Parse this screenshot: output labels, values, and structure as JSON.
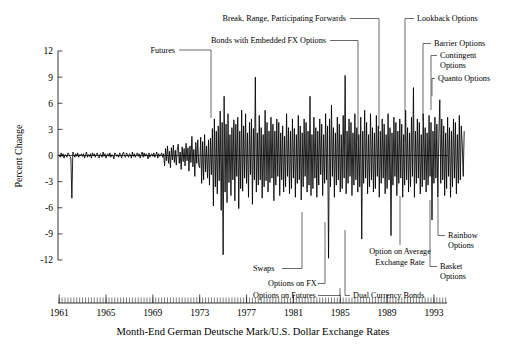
{
  "chart_data": {
    "type": "line",
    "title": "",
    "subtitle": "",
    "xlabel": "Month-End German Deutsche Mark/U.S. Dollar Exchange Rates",
    "ylabel": "Percent Change",
    "xlim": [
      1960.9,
      1994.2
    ],
    "ylim": [
      -12,
      12
    ],
    "grid": false,
    "legend": null,
    "x_ticks": [
      "1961",
      "1965",
      "1969",
      "1973",
      "1977",
      "1981",
      "1985",
      "1989",
      "1993"
    ],
    "x_tick_values": [
      1961,
      1965,
      1969,
      1973,
      1977,
      1981,
      1985,
      1989,
      1993
    ],
    "x_minor_tick_step": 0.25,
    "y_ticks": [
      "12",
      "9",
      "6",
      "3",
      "0",
      "-3",
      "-6",
      "-9",
      "-12"
    ],
    "y_tick_values": [
      12,
      9,
      6,
      3,
      0,
      -3,
      -6,
      -9,
      -12
    ],
    "series": [
      {
        "name": "Monthly percent change, DM/USD",
        "x_start": 1961.0,
        "x_step": 0.0833333,
        "values": [
          0.1,
          -0.2,
          0.3,
          -0.1,
          0.2,
          -0.3,
          0.1,
          0.0,
          -0.2,
          0.3,
          0.1,
          -0.1,
          -0.3,
          -4.9,
          0.4,
          0.1,
          -0.2,
          0.2,
          -0.1,
          0.3,
          -0.2,
          0.1,
          0.0,
          0.2,
          -0.1,
          0.2,
          -0.3,
          0.1,
          0.4,
          -0.2,
          0.1,
          -0.1,
          0.2,
          -0.3,
          0.3,
          0.0,
          0.2,
          -0.2,
          0.1,
          0.3,
          -0.1,
          -0.3,
          0.2,
          0.1,
          -0.2,
          0.4,
          -0.1,
          0.2,
          -0.3,
          0.1,
          0.2,
          -0.1,
          0.3,
          -0.2,
          0.1,
          0.0,
          -0.4,
          0.3,
          0.2,
          -0.1,
          0.1,
          -0.2,
          0.3,
          0.1,
          -0.3,
          0.2,
          0.4,
          -0.1,
          -0.2,
          0.3,
          0.1,
          -0.2,
          0.2,
          0.1,
          -0.3,
          0.4,
          -0.1,
          0.2,
          -0.2,
          0.1,
          0.3,
          -0.1,
          0.2,
          -0.3,
          0.1,
          0.4,
          -0.2,
          0.3,
          -0.1,
          0.2,
          0.1,
          -0.4,
          0.3,
          -0.2,
          0.1,
          0.2,
          -0.1,
          0.3,
          -0.2,
          0.1,
          0.4,
          -0.3,
          0.2,
          -0.1,
          0.1,
          0.3,
          -0.2,
          0.2,
          -1.2,
          0.8,
          -0.6,
          1.1,
          -0.9,
          0.5,
          -1.4,
          0.9,
          -0.5,
          1.2,
          -0.8,
          0.6,
          -1.1,
          0.7,
          1.3,
          -0.9,
          0.4,
          -1.6,
          1.0,
          -0.7,
          0.8,
          -1.2,
          1.4,
          -0.6,
          0.9,
          -1.8,
          1.1,
          -0.8,
          2.2,
          -1.3,
          0.7,
          -2.4,
          1.5,
          -0.9,
          1.8,
          -1.1,
          -1.4,
          2.1,
          -3.2,
          1.6,
          -2.8,
          2.4,
          -1.9,
          1.1,
          -2.6,
          1.8,
          -3.4,
          2.0,
          -2.2,
          3.1,
          -5.8,
          4.2,
          -3.6,
          2.8,
          -4.4,
          3.4,
          -2.9,
          5.1,
          -6.3,
          3.8,
          -11.4,
          6.8,
          -4.2,
          3.6,
          -5.4,
          4.8,
          -3.1,
          2.4,
          -4.6,
          3.2,
          -2.8,
          4.1,
          -5.2,
          3.6,
          -2.4,
          4.4,
          -6.1,
          2.8,
          -3.8,
          5.2,
          -4.1,
          3.4,
          -2.6,
          4.8,
          -3.2,
          2.6,
          -4.8,
          3.8,
          -2.2,
          4.2,
          -5.6,
          3.1,
          -2.8,
          9.0,
          -4.2,
          2.6,
          -3.4,
          4.6,
          -2.8,
          3.2,
          -4.9,
          2.4,
          -3.6,
          5.2,
          -2.9,
          3.8,
          -4.2,
          2.8,
          -3.1,
          4.4,
          -2.6,
          3.6,
          -5.2,
          2.8,
          -3.4,
          4.2,
          -2.4,
          3.8,
          -4.6,
          2.6,
          -2.8,
          3.4,
          -4.2,
          2.2,
          -3.6,
          4.8,
          -2.4,
          3.2,
          -4.4,
          2.8,
          -3.8,
          4.2,
          -2.6,
          3.1,
          -4.8,
          2.4,
          -3.2,
          4.6,
          -2.8,
          3.4,
          -5.1,
          2.6,
          -3.6,
          4.2,
          -2.4,
          3.8,
          -4.2,
          2.8,
          -3.4,
          6.8,
          -4.6,
          2.4,
          -3.8,
          4.4,
          -2.6,
          3.2,
          -4.8,
          2.8,
          -3.4,
          4.2,
          -2.2,
          3.6,
          -4.6,
          2.4,
          -3.2,
          4.8,
          -2.8,
          3.4,
          -11.8,
          4.2,
          -3.6,
          5.8,
          -2.4,
          3.2,
          -4.8,
          2.6,
          -3.4,
          4.4,
          -2.8,
          3.6,
          -4.2,
          2.4,
          -3.8,
          4.6,
          -2.6,
          9.2,
          -4.4,
          2.8,
          -3.2,
          4.2,
          -2.4,
          3.8,
          -4.6,
          2.6,
          -3.4,
          4.8,
          -2.8,
          3.2,
          -4.2,
          2.4,
          -3.6,
          4.4,
          -9.6,
          2.8,
          -3.2,
          5.2,
          -2.6,
          3.8,
          -4.4,
          2.4,
          -3.6,
          4.8,
          -2.8,
          3.2,
          -4.2,
          2.6,
          -3.8,
          4.6,
          -2.4,
          3.4,
          -4.8,
          2.8,
          -3.2,
          4.2,
          -2.6,
          3.6,
          -4.4,
          2.4,
          -3.8,
          4.8,
          -2.8,
          3.2,
          -9.2,
          2.6,
          -3.4,
          4.4,
          -2.4,
          3.8,
          -4.6,
          2.8,
          -3.2,
          4.2,
          -2.6,
          3.6,
          -4.8,
          2.4,
          -3.4,
          5.2,
          -2.8,
          3.2,
          -4.2,
          2.6,
          -3.6,
          4.4,
          -2.4,
          7.8,
          -4.8,
          2.8,
          -3.2,
          4.2,
          -2.6,
          3.8,
          -4.4,
          2.4,
          -3.6,
          4.8,
          -2.8,
          3.2,
          -4.2,
          2.6,
          -3.4,
          4.6,
          -2.4,
          3.8,
          -7.4,
          2.8,
          -3.2,
          4.4,
          -2.6,
          3.6,
          -4.8,
          2.4,
          6.4,
          -3.2,
          4.2,
          -2.8,
          3.4,
          -4.6,
          2.6,
          -3.8,
          4.4,
          -2.4,
          3.2,
          -4.8,
          2.8,
          -3.6,
          4.2,
          -2.6,
          3.8,
          -4.4,
          2.4,
          -3.2,
          4.6,
          -2.8,
          3.4,
          1.2,
          -2.4,
          2.8
        ]
      }
    ],
    "annotations": [
      {
        "label": "Futures",
        "year": 1972.3,
        "note": "leader to 1972 vertical drop"
      },
      {
        "label": "Swaps",
        "year": 1981.1,
        "note": "leader from below"
      },
      {
        "label": "Options on FX",
        "year": 1982.5,
        "note": "leader from below"
      },
      {
        "label": "Options on Futures",
        "year": 1984.4,
        "note": "leader from below"
      },
      {
        "label": "Dual Currency Bonds",
        "year": 1985.1,
        "note": "leader from below"
      },
      {
        "label": "Bonds with Embedded FX Options",
        "year": 1985.6,
        "note": "leader from above"
      },
      {
        "label": "Break, Range, Participating Forwards",
        "year": 1987.1,
        "note": "leader from above"
      },
      {
        "label": "Option on Average Exchange Rate",
        "year": 1987.9,
        "note": "leader from below"
      },
      {
        "label": "Lookback Options",
        "year": 1988.8,
        "note": "leader from above"
      },
      {
        "label": "Barrier Options",
        "year": 1989.8,
        "note": "leader from above"
      },
      {
        "label": "Contingent Options",
        "year": 1990.4,
        "note": "leader from above"
      },
      {
        "label": "Quanto Options",
        "year": 1990.9,
        "note": "leader from above"
      },
      {
        "label": "Basket Options",
        "year": 1991.6,
        "note": "leader from below"
      },
      {
        "label": "Rainbow Options",
        "year": 1991.3,
        "note": "leader from below"
      }
    ]
  },
  "annotations_text": {
    "futures": "Futures",
    "swaps": "Swaps",
    "options_on_fx": "Options on FX",
    "options_on_futures": "Options on Futures",
    "dual_currency_bonds": "Dual Currency Bonds",
    "bonds_embedded_fx": "Bonds with Embedded FX Options",
    "break_range_participating": "Break, Range, Participating Forwards",
    "option_on_average_line1": "Option on Average",
    "option_on_average_line2": "Exchange Rate",
    "lookback": "Lookback Options",
    "barrier": "Barrier Options",
    "contingent_line1": "Contingent",
    "contingent_line2": "Options",
    "quanto": "Quanto Options",
    "basket_line1": "Basket",
    "basket_line2": "Options",
    "rainbow_line1": "Rainbow",
    "rainbow_line2": "Options"
  },
  "axes": {
    "y_title": "Percent Change",
    "x_caption": "Month-End German Deutsche Mark/U.S. Dollar Exchange Rates",
    "y_labels": [
      "12",
      "9",
      "6",
      "3",
      "0",
      "-3",
      "-6",
      "-9",
      "-12"
    ],
    "x_labels": [
      "1961",
      "1965",
      "1969",
      "1973",
      "1977",
      "1981",
      "1985",
      "1989",
      "1993"
    ]
  },
  "colors": {
    "background": "#ffffff",
    "series": "#000000",
    "axis": "#000000",
    "leader": "#2b2b2b",
    "text": "#000000"
  }
}
